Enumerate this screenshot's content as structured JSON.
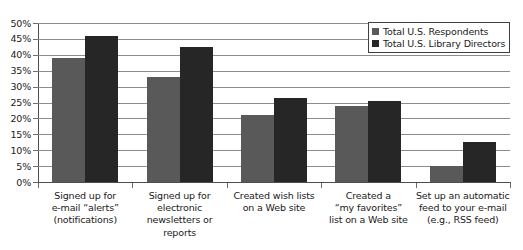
{
  "chart_data": {
    "type": "bar",
    "title": "",
    "xlabel": "",
    "ylabel": "",
    "ylim": [
      0,
      50
    ],
    "ytick_labels": [
      "50%",
      "45%",
      "40%",
      "35%",
      "30%",
      "25%",
      "20%",
      "15%",
      "10%",
      "5%",
      "0%"
    ],
    "ytick_values": [
      50,
      45,
      40,
      35,
      30,
      25,
      20,
      15,
      10,
      5,
      0
    ],
    "grid": true,
    "legend_position": "top-right",
    "categories": [
      "Signed up for\ne-mail “alerts”\n(notifications)",
      "Signed up for\nelectronic\nnewsletters or\nreports",
      "Created wish lists\non a Web site",
      "Created a\n“my favorites”\nlist on a Web site",
      "Set up an automatic\nfeed to your e-mail\n(e.g., RSS feed)"
    ],
    "series": [
      {
        "name": "Total U.S. Respondents",
        "color": "#595959",
        "values": [
          39,
          33,
          21,
          24,
          5
        ]
      },
      {
        "name": "Total U.S. Library Directors",
        "color": "#262626",
        "values": [
          46,
          42.5,
          26.5,
          25.5,
          12.5
        ]
      }
    ]
  }
}
